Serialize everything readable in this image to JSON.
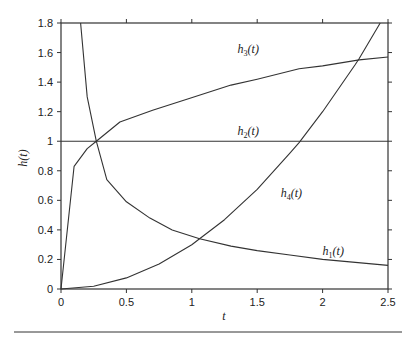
{
  "chart_data": {
    "type": "line",
    "title": "",
    "xlabel": "t",
    "ylabel": "h(t)",
    "xlim": [
      0,
      2.5
    ],
    "ylim": [
      0,
      1.8
    ],
    "grid": false,
    "legend": "inline labels",
    "x_ticks": [
      "0",
      "0.5",
      "1",
      "1.5",
      "2",
      "2.5"
    ],
    "y_ticks": [
      "0",
      "0.2",
      "0.4",
      "0.6",
      "0.8",
      "1",
      "1.2",
      "1.4",
      "1.6",
      "1.8"
    ],
    "series": [
      {
        "name": "h1(t)",
        "label": "h1(t)",
        "x": [
          0.15,
          0.2,
          0.27,
          0.35,
          0.5,
          0.68,
          0.85,
          1.06,
          1.3,
          1.5,
          1.75,
          2.0,
          2.25,
          2.5
        ],
        "values": [
          1.8,
          1.3,
          1.0,
          0.74,
          0.59,
          0.48,
          0.4,
          0.34,
          0.29,
          0.26,
          0.23,
          0.2,
          0.18,
          0.16
        ]
      },
      {
        "name": "h2(t)",
        "label": "h2(t)",
        "x": [
          0,
          2.5
        ],
        "values": [
          1.0,
          1.0
        ]
      },
      {
        "name": "h3(t)",
        "label": "h3(t)",
        "x": [
          0,
          0.1,
          0.2,
          0.27,
          0.45,
          0.7,
          0.98,
          1.3,
          1.5,
          1.82,
          2.0,
          2.28,
          2.5
        ],
        "values": [
          0,
          0.83,
          0.95,
          1.0,
          1.13,
          1.21,
          1.29,
          1.38,
          1.42,
          1.49,
          1.51,
          1.55,
          1.57
        ]
      },
      {
        "name": "h4(t)",
        "label": "h4(t)",
        "x": [
          0,
          0.25,
          0.5,
          0.75,
          1.0,
          1.06,
          1.25,
          1.5,
          1.75,
          1.82,
          2.0,
          2.25,
          2.28,
          2.44
        ],
        "values": [
          0,
          0.019,
          0.075,
          0.169,
          0.3,
          0.34,
          0.469,
          0.675,
          0.919,
          0.99,
          1.2,
          1.519,
          1.56,
          1.8
        ]
      }
    ],
    "annotations": [
      {
        "text": "h3(t)",
        "base": "h",
        "sub": "3",
        "arg": "(t)",
        "x": 1.35,
        "y": 1.6
      },
      {
        "text": "h2(t)",
        "base": "h",
        "sub": "2",
        "arg": "(t)",
        "x": 1.35,
        "y": 1.04
      },
      {
        "text": "h4(t)",
        "base": "h",
        "sub": "4",
        "arg": "(t)",
        "x": 1.68,
        "y": 0.62
      },
      {
        "text": "h1(t)",
        "base": "h",
        "sub": "1",
        "arg": "(t)",
        "x": 2.0,
        "y": 0.23
      }
    ]
  },
  "axes": {
    "x_title": "t",
    "y_title_base": "h",
    "y_title_arg": "(t)"
  }
}
